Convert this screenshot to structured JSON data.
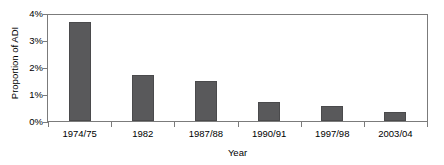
{
  "chart_data": {
    "type": "bar",
    "title": "",
    "categories": [
      "1974/75",
      "1982",
      "1987/88",
      "1990/91",
      "1997/98",
      "2003/04"
    ],
    "values": [
      3.74,
      1.74,
      1.52,
      0.7,
      0.55,
      0.33
    ],
    "xlabel": "Year",
    "ylabel": "Proportion of ADI",
    "ylim": [
      0,
      4
    ],
    "ytick_values": [
      0,
      1,
      2,
      3,
      4
    ],
    "ytick_labels": [
      "0%",
      "1%",
      "2%",
      "3%",
      "4%"
    ],
    "grid": false,
    "legend": false,
    "bar_color": "#59595b",
    "axis_color": "#7b7b7b",
    "background": "#ffffff"
  }
}
